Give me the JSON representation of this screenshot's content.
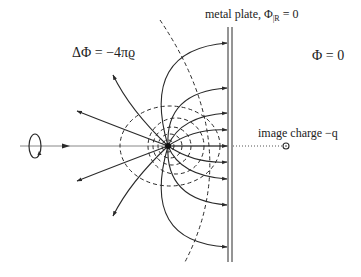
{
  "figure": {
    "labels": {
      "poisson": "ΔΦ = −4πϱ",
      "plate": "metal plate, Φ|R = 0",
      "plate_main": "metal plate, Φ",
      "plate_sub": "|R",
      "plate_eq": " = 0",
      "right_region": "Φ = 0",
      "image_charge": "image charge −q"
    },
    "elements": {
      "charge": {
        "x": 168,
        "y": 146,
        "symbol": "point charge q"
      },
      "image_charge": {
        "x": 286,
        "y": 146,
        "symbol": "circle"
      },
      "plate": {
        "x": 230,
        "y_top": 27,
        "y_bottom": 262
      }
    },
    "colors": {
      "line": "#2a2a2a",
      "axis": "#888888",
      "background": "#ffffff"
    }
  }
}
